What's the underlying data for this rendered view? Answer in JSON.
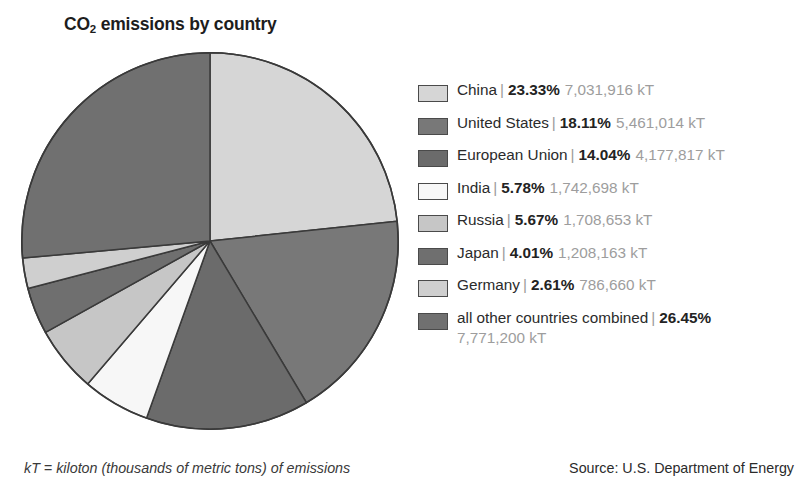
{
  "chart_data": {
    "type": "pie",
    "title": "CO2 emissions by country",
    "title_main": "CO",
    "title_sub": "2",
    "title_rest": " emissions by country",
    "unit": "kT",
    "start_angle_deg": 0,
    "direction": "clockwise",
    "categories": [
      "China",
      "United States",
      "European Union",
      "India",
      "Russia",
      "Japan",
      "Germany",
      "all other countries combined"
    ],
    "values": [
      23.33,
      18.11,
      14.04,
      5.78,
      5.67,
      4.01,
      2.61,
      26.45
    ],
    "absolute_values": [
      7031916,
      5461014,
      4177817,
      1742698,
      1708653,
      1208163,
      786660,
      7771200
    ],
    "slice_colors": [
      "#d6d6d6",
      "#787878",
      "#6b6b6b",
      "#f7f7f7",
      "#c6c6c6",
      "#6f6f6f",
      "#cfcfcf",
      "#707070"
    ],
    "legend_position": "right",
    "grid": false,
    "xlabel": "",
    "ylabel": ""
  },
  "legend": {
    "items": [
      {
        "name": "China",
        "separator": "|",
        "percent": "23.33%",
        "kt": "7,031,916 kT",
        "swatch": "#d6d6d6"
      },
      {
        "name": "United States",
        "separator": "|",
        "percent": "18.11%",
        "kt": "5,461,014 kT",
        "swatch": "#787878"
      },
      {
        "name": "European Union",
        "separator": "|",
        "percent": "14.04%",
        "kt": "4,177,817 kT",
        "swatch": "#6b6b6b"
      },
      {
        "name": "India",
        "separator": "|",
        "percent": "5.78%",
        "kt": "1,742,698 kT",
        "swatch": "#f7f7f7"
      },
      {
        "name": "Russia",
        "separator": "|",
        "percent": "5.67%",
        "kt": "1,708,653 kT",
        "swatch": "#c6c6c6"
      },
      {
        "name": "Japan",
        "separator": "|",
        "percent": "4.01%",
        "kt": "1,208,163 kT",
        "swatch": "#6f6f6f"
      },
      {
        "name": "Germany",
        "separator": "|",
        "percent": "2.61%",
        "kt": "786,660 kT",
        "swatch": "#cfcfcf"
      },
      {
        "name": "all other countries combined",
        "separator": "|",
        "percent": "26.45%",
        "kt": "7,771,200 kT",
        "swatch": "#707070"
      }
    ]
  },
  "footnote": "kT = kiloton (thousands of metric tons) of emissions",
  "source": "Source: U.S. Department of Energy"
}
